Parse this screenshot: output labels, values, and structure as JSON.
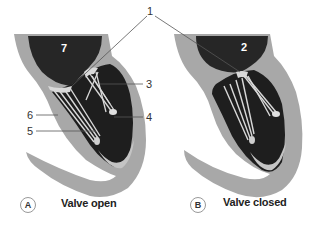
{
  "figure": {
    "panels": [
      {
        "id": "A",
        "caption": "Valve open",
        "chamber_label": "7"
      },
      {
        "id": "B",
        "caption": "Valve closed",
        "chamber_label": "2"
      }
    ],
    "callouts": [
      {
        "label": "1",
        "target": "valve leaflets (both panels)"
      },
      {
        "label": "3",
        "target": "chordae tendineae"
      },
      {
        "label": "4",
        "target": "papillary muscle tip"
      },
      {
        "label": "5",
        "target": "papillary muscle"
      },
      {
        "label": "6",
        "target": "ventricular wall"
      }
    ],
    "colors": {
      "wall": "#a8a8a8",
      "chamber": "#262626",
      "ventricle": "#1a1a1a",
      "chordae": "#d9d9d9",
      "leader_line": "#555555"
    }
  }
}
